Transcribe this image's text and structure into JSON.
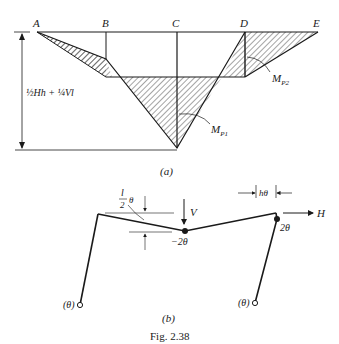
{
  "figure": {
    "caption": "Fig. 2.38",
    "part_a": {
      "label": "(a)",
      "points": [
        "A",
        "B",
        "C",
        "D",
        "E"
      ],
      "dimension_label": "½Hh + ¼Vl",
      "moment_labels": {
        "mp1": "M",
        "mp1_sub": "P1",
        "mp2": "M",
        "mp2_sub": "P2"
      }
    },
    "part_b": {
      "label": "(b)",
      "load_v": "V",
      "load_h": "H",
      "deflection_label_num": "l",
      "deflection_label_den": "2",
      "deflection_label_theta": "θ",
      "sway_label": "hθ",
      "rotation_mid": "−2θ",
      "rotation_right": "2θ",
      "rotation_left_base": "(θ)",
      "rotation_right_base": "(θ)"
    }
  },
  "colors": {
    "ink": "#1a1a1a",
    "background": "#ffffff"
  }
}
